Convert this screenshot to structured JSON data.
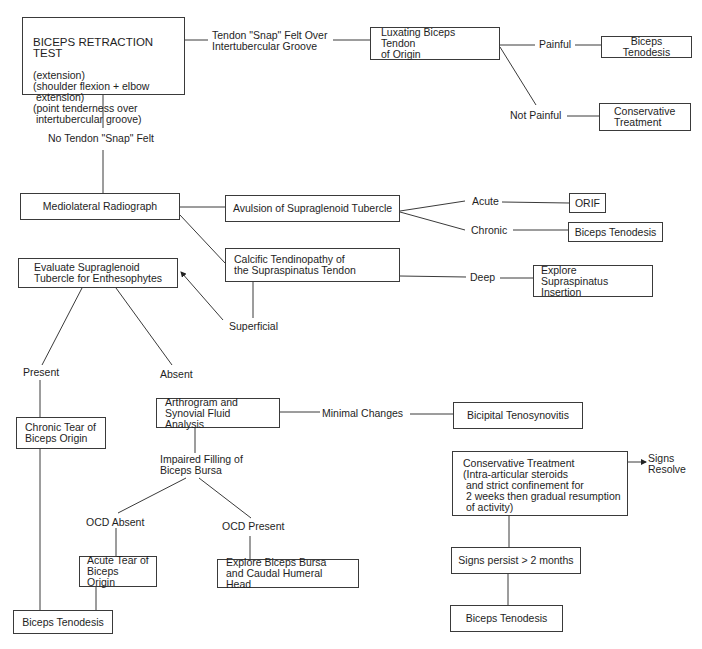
{
  "nodes": {
    "retraction_test": {
      "title": "BICEPS RETRACTION TEST",
      "lines": "(extension)\n(shoulder flexion + elbow\n extension)\n(point tenderness over\n intertubercular groove)"
    },
    "luxating": "Luxating Biceps Tendon\nof Origin",
    "tenodesis_1": "Biceps Tenodesis",
    "conservative_1": "Conservative\nTreatment",
    "mediolateral": "Mediolateral Radiograph",
    "avulsion": "Avulsion of Supraglenoid Tubercle",
    "orif": "ORIF",
    "tenodesis_2": "Biceps Tenodesis",
    "calcific": "Calcific Tendinopathy of\nthe Supraspinatus Tendon",
    "explore_supraspinatus": "Explore Supraspinatus\nInsertion",
    "evaluate": "Evaluate Supraglenoid\nTubercle for Enthesophytes",
    "chronic_tear": "Chronic Tear of\nBiceps Origin",
    "arthrogram": "Arthrogram and\nSynovial Fluid Analysis",
    "bicipital": "Bicipital Tenosynovitis",
    "conservative_2": "Conservative Treatment\n(Intra-articular steroids\n and strict confinement for\n 2 weeks then gradual resumption\n of activity)",
    "acute_tear": "Acute Tear of\nBiceps Origin",
    "explore_bursa": "Explore Biceps Bursa\nand Caudal Humeral Head",
    "signs_persist": "Signs persist > 2 months",
    "tenodesis_3": "Biceps Tenodesis",
    "tenodesis_4": "Biceps Tenodesis"
  },
  "labels": {
    "snap_felt": "Tendon \"Snap\" Felt Over\nIntertubercular Groove",
    "no_snap": "No Tendon \"Snap\" Felt",
    "painful": "Painful",
    "not_painful": "Not Painful",
    "acute": "Acute",
    "chronic": "Chronic",
    "deep": "Deep",
    "superficial": "Superficial",
    "present": "Present",
    "absent": "Absent",
    "minimal_changes": "Minimal Changes",
    "impaired_filling": "Impaired Filling of\nBiceps Bursa",
    "ocd_absent": "OCD Absent",
    "ocd_present": "OCD Present",
    "signs_resolve": "Signs\nResolve"
  }
}
